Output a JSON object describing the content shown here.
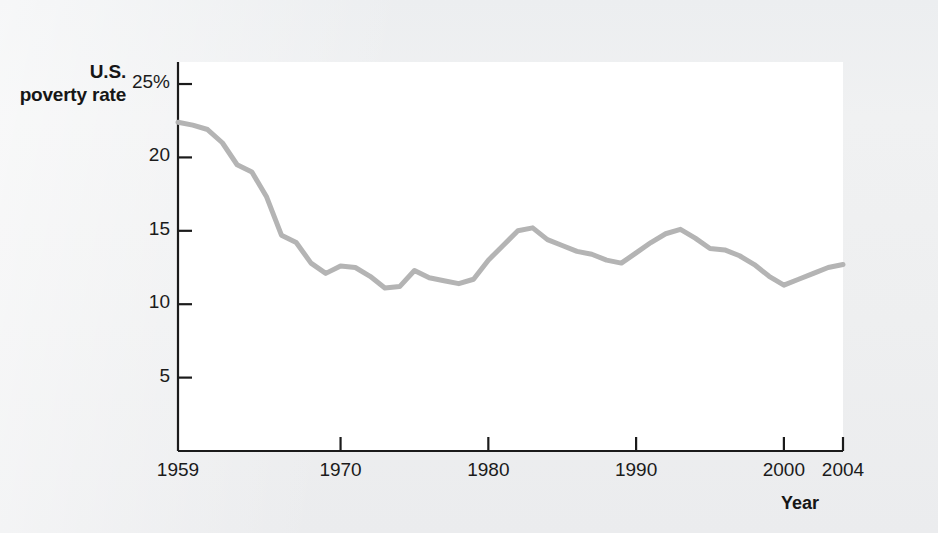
{
  "page": {
    "background_color": "#eff0f1",
    "plot_background_color": "#ffffff",
    "ghost_text_top": "faint bleed-through text",
    "ghost_text_bottom": "faint bleed-through text"
  },
  "chart_data": {
    "type": "line",
    "title": "",
    "subtitle": "",
    "ylabel": "U.S. poverty rate",
    "xlabel": "Year",
    "xlim": [
      1959,
      2004
    ],
    "ylim": [
      0,
      26.5
    ],
    "grid": false,
    "legend": "none",
    "line_color": "#b4b4b4",
    "line_width": 5,
    "axis_color": "#1b1b1b",
    "y_ticks": [
      {
        "value": 25,
        "label": "25%"
      },
      {
        "value": 20,
        "label": "20"
      },
      {
        "value": 15,
        "label": "15"
      },
      {
        "value": 10,
        "label": "10"
      },
      {
        "value": 5,
        "label": "5"
      }
    ],
    "x_ticks": [
      {
        "value": 1959,
        "label": "1959"
      },
      {
        "value": 1970,
        "label": "1970"
      },
      {
        "value": 1980,
        "label": "1980"
      },
      {
        "value": 1990,
        "label": "1990"
      },
      {
        "value": 2000,
        "label": "2000"
      },
      {
        "value": 2004,
        "label": "2004"
      }
    ],
    "x": [
      1959,
      1960,
      1961,
      1962,
      1963,
      1964,
      1965,
      1966,
      1967,
      1968,
      1969,
      1970,
      1971,
      1972,
      1973,
      1974,
      1975,
      1976,
      1977,
      1978,
      1979,
      1980,
      1981,
      1982,
      1983,
      1984,
      1985,
      1986,
      1987,
      1988,
      1989,
      1990,
      1991,
      1992,
      1993,
      1994,
      1995,
      1996,
      1997,
      1998,
      1999,
      2000,
      2001,
      2002,
      2003,
      2004
    ],
    "values": [
      22.4,
      22.2,
      21.9,
      21.0,
      19.5,
      19.0,
      17.3,
      14.7,
      14.2,
      12.8,
      12.1,
      12.6,
      12.5,
      11.9,
      11.1,
      11.2,
      12.3,
      11.8,
      11.6,
      11.4,
      11.7,
      13.0,
      14.0,
      15.0,
      15.2,
      14.4,
      14.0,
      13.6,
      13.4,
      13.0,
      12.8,
      13.5,
      14.2,
      14.8,
      15.1,
      14.5,
      13.8,
      13.7,
      13.3,
      12.7,
      11.9,
      11.3,
      11.7,
      12.1,
      12.5,
      12.7
    ],
    "series": [
      {
        "name": "U.S. poverty rate",
        "values": [
          22.4,
          22.2,
          21.9,
          21.0,
          19.5,
          19.0,
          17.3,
          14.7,
          14.2,
          12.8,
          12.1,
          12.6,
          12.5,
          11.9,
          11.1,
          11.2,
          12.3,
          11.8,
          11.6,
          11.4,
          11.7,
          13.0,
          14.0,
          15.0,
          15.2,
          14.4,
          14.0,
          13.6,
          13.4,
          13.0,
          12.8,
          13.5,
          14.2,
          14.8,
          15.1,
          14.5,
          13.8,
          13.7,
          13.3,
          12.7,
          11.9,
          11.3,
          11.7,
          12.1,
          12.5,
          12.7
        ]
      }
    ]
  }
}
